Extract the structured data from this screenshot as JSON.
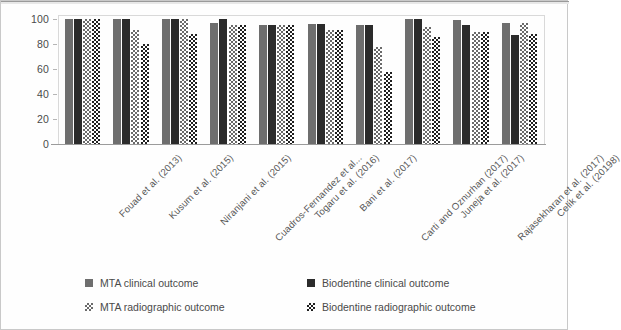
{
  "chart_data": {
    "type": "bar",
    "title": "",
    "subtitle": "",
    "xlabel": "",
    "ylabel": "",
    "ylim": [
      0,
      100
    ],
    "yticks": [
      0,
      20,
      40,
      60,
      80,
      100
    ],
    "ytick_labels": [
      "0",
      "20",
      "40",
      "60",
      "80",
      "100"
    ],
    "grid": false,
    "legend_position": "bottom",
    "orientation": "vertical",
    "categories": [
      "Fouad et al. (2013)",
      "Kusum et al. (2015)",
      "Niranjani et al. (2015)",
      "Cuadros-Fernandez et al...",
      "Togaru et al. (2016)",
      "Bani et al. (2017)",
      "Carti and Oznurhan (2017)",
      "Juneja et al. (2017)",
      "Rajasekharan et al. (2017)",
      "Celik et al. (20198)"
    ],
    "series": [
      {
        "name": "MTA clinical outcome",
        "color": "#6e6e6e",
        "pattern": "solid",
        "values": [
          100,
          100,
          100,
          97,
          95,
          96,
          95,
          100,
          99,
          97
        ]
      },
      {
        "name": "Biodentine clinical outcome",
        "color": "#2b2b2b",
        "pattern": "solid",
        "values": [
          100,
          100,
          100,
          100,
          95,
          96,
          95,
          100,
          95,
          87
        ]
      },
      {
        "name": "MTA radiographic outcome",
        "color": "#6a6a6a",
        "pattern": "checker",
        "values": [
          100,
          91,
          100,
          95,
          95,
          91,
          78,
          94,
          90,
          97
        ]
      },
      {
        "name": "Biodentine radiographic outcome",
        "color": "#1f1f1f",
        "pattern": "checker",
        "values": [
          100,
          80,
          88,
          95,
          95,
          91,
          58,
          86,
          90,
          88
        ]
      }
    ]
  },
  "legend": {
    "items": [
      {
        "label": "MTA clinical outcome",
        "swatch": "solid-gray-swatch"
      },
      {
        "label": "Biodentine clinical outcome",
        "swatch": "solid-black-swatch"
      },
      {
        "label": "MTA radiographic outcome",
        "swatch": "checker-gray-swatch"
      },
      {
        "label": "Biodentine radiographic outcome",
        "swatch": "checker-black-swatch"
      }
    ]
  }
}
